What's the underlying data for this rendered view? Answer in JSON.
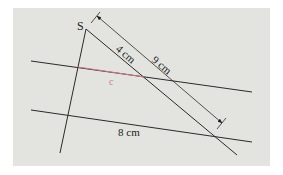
{
  "diagram": {
    "point_label": "S",
    "segment_label": "c",
    "labels": {
      "short_side": "4 cm",
      "long_side": "9 cm",
      "base": "8 cm"
    },
    "colors": {
      "background": "#e3e4e0",
      "lines": "#2a2a2a",
      "highlight": "#d07a86"
    }
  }
}
